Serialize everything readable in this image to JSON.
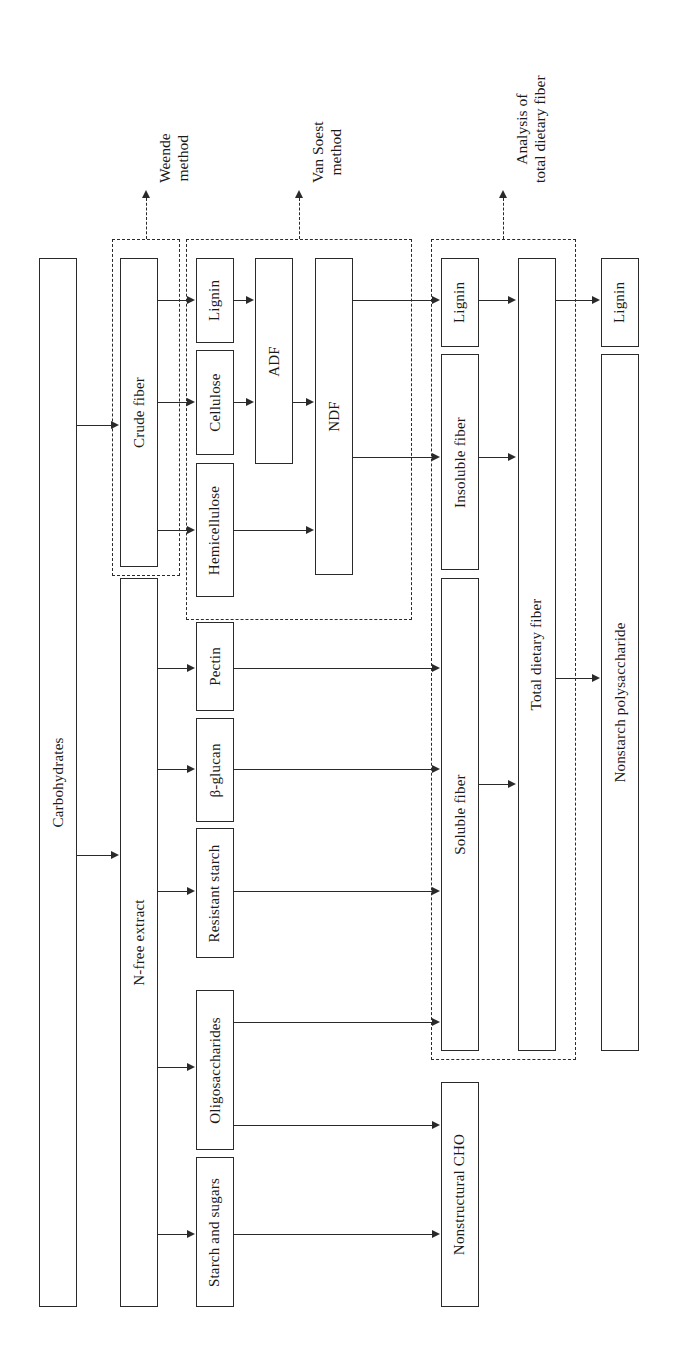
{
  "diagram": {
    "orientation": "rotated-90-ccw",
    "method_labels": [
      {
        "id": "weende",
        "line1": "Weende",
        "line2": "method"
      },
      {
        "id": "vansoest",
        "line1": "Van Soest",
        "line2": "method"
      },
      {
        "id": "tdf",
        "line1": "Analysis of",
        "line2": "total dietary fiber"
      }
    ],
    "boxes": [
      {
        "id": "carbohydrates",
        "label": "Carbohydrates"
      },
      {
        "id": "crude-fiber",
        "label": "Crude fiber"
      },
      {
        "id": "n-free-extract",
        "label": "N-free extract"
      },
      {
        "id": "lignin-1",
        "label": "Lignin"
      },
      {
        "id": "cellulose",
        "label": "Cellulose"
      },
      {
        "id": "hemicellulose",
        "label": "Hemicellulose"
      },
      {
        "id": "pectin",
        "label": "Pectin"
      },
      {
        "id": "beta-glucan",
        "label": "β-glucan"
      },
      {
        "id": "resistant-starch",
        "label": "Resistant starch"
      },
      {
        "id": "oligosaccharides",
        "label": "Oligosaccharides"
      },
      {
        "id": "starch-and-sugars",
        "label": "Starch and sugars"
      },
      {
        "id": "adf",
        "label": "ADF"
      },
      {
        "id": "ndf",
        "label": "NDF"
      },
      {
        "id": "lignin-2",
        "label": "Lignin"
      },
      {
        "id": "insoluble-fiber",
        "label": "Insoluble fiber"
      },
      {
        "id": "soluble-fiber",
        "label": "Soluble fiber"
      },
      {
        "id": "total-dietary-fiber",
        "label": "Total dietary fiber"
      },
      {
        "id": "lignin-3",
        "label": "Lignin"
      },
      {
        "id": "nonstarch-polysaccharide",
        "label": "Nonstarch polysaccharide"
      },
      {
        "id": "nonstructural-cho",
        "label": "Nonstructural CHO"
      }
    ],
    "colors": {
      "stroke": "#2a2a2a",
      "background": "#ffffff"
    }
  }
}
